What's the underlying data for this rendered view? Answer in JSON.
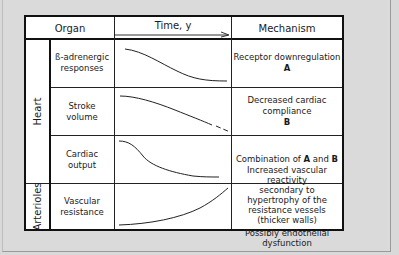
{
  "header": {
    "organ": "Organ",
    "time": "Time, y",
    "mechanism": "Mechanism"
  },
  "groups": [
    {
      "label": "Heart"
    },
    {
      "label": "Arterioles"
    }
  ],
  "rows": [
    {
      "organ_line1": "ß-adrenergic",
      "organ_line2": "responses",
      "trend": "decreasing sigmoid",
      "mechanism_line1": "Receptor downregulation",
      "mechanism_tag": "A"
    },
    {
      "organ_line1": "Stroke",
      "organ_line2": "volume",
      "trend": "decreasing linear",
      "mechanism_line1": "Decreased cardiac compliance",
      "mechanism_tag": "B"
    },
    {
      "organ_line1": "Cardiac",
      "organ_line2": "output",
      "trend": "decreasing steep early",
      "mechanism_prefix": "Combination of ",
      "mechanism_a": "A",
      "mechanism_and": " and ",
      "mechanism_b": "B"
    },
    {
      "organ_line1": "Vascular",
      "organ_line2": "resistance",
      "trend": "increasing",
      "mechanism_line1": "Increased vascular reactivity",
      "mechanism_line2": "secondary to hypertrophy of the",
      "mechanism_line3": "resistance vessels (thicker walls)",
      "mechanism_line4": "Possibly endothelial dysfunction"
    }
  ]
}
